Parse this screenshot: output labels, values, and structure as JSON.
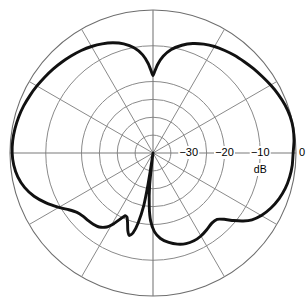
{
  "chart_data": {
    "type": "line",
    "plot_kind": "polar-radiation-pattern",
    "title": "",
    "subtitle": "",
    "xlabel": "",
    "ylabel": "",
    "unit_label": "dB",
    "radial_axis": {
      "label": "dB",
      "tick_labels": [
        "−30",
        "−20",
        "−10",
        "0"
      ],
      "tick_values": [
        -30,
        -20,
        -10,
        0
      ],
      "min": -40,
      "max": 0,
      "tick_angle_deg": 0
    },
    "angular_axis": {
      "spoke_interval_deg": 30,
      "spoke_angles_deg": [
        0,
        30,
        60,
        90,
        120,
        150,
        180,
        210,
        240,
        270,
        300,
        330
      ],
      "tick_labels": []
    },
    "grid": {
      "enabled": true,
      "rings_db": [
        -35,
        -30,
        -25,
        -20,
        -10,
        0
      ],
      "ring_color": "#8a8a8a",
      "outer_ring_color": "#6e6e6e"
    },
    "legend": {
      "position": "none",
      "entries": []
    },
    "series": [
      {
        "name": "pattern",
        "color": "#111111",
        "line_width": 2.9,
        "closed": true,
        "points_polar_deg_db": [
          [
            0,
            -0.8
          ],
          [
            5,
            -0.4
          ],
          [
            10,
            -0.2
          ],
          [
            15,
            -0.3
          ],
          [
            20,
            -0.7
          ],
          [
            25,
            -1.3
          ],
          [
            30,
            -2.0
          ],
          [
            35,
            -2.7
          ],
          [
            40,
            -3.3
          ],
          [
            45,
            -3.9
          ],
          [
            50,
            -4.4
          ],
          [
            55,
            -5.0
          ],
          [
            60,
            -5.6
          ],
          [
            65,
            -6.4
          ],
          [
            70,
            -7.4
          ],
          [
            75,
            -8.8
          ],
          [
            80,
            -10.6
          ],
          [
            84,
            -12.8
          ],
          [
            87,
            -15.2
          ],
          [
            89,
            -17.4
          ],
          [
            90,
            -18.4
          ],
          [
            91,
            -17.4
          ],
          [
            93,
            -15.0
          ],
          [
            96,
            -12.4
          ],
          [
            100,
            -10.2
          ],
          [
            105,
            -8.4
          ],
          [
            110,
            -7.2
          ],
          [
            115,
            -6.3
          ],
          [
            120,
            -5.6
          ],
          [
            125,
            -5.0
          ],
          [
            130,
            -4.5
          ],
          [
            135,
            -4.0
          ],
          [
            140,
            -3.5
          ],
          [
            145,
            -3.0
          ],
          [
            150,
            -2.5
          ],
          [
            155,
            -2.0
          ],
          [
            160,
            -1.5
          ],
          [
            165,
            -1.1
          ],
          [
            170,
            -0.8
          ],
          [
            175,
            -0.6
          ],
          [
            180,
            -0.6
          ],
          [
            185,
            -0.9
          ],
          [
            190,
            -1.6
          ],
          [
            195,
            -2.8
          ],
          [
            200,
            -4.6
          ],
          [
            205,
            -7.0
          ],
          [
            210,
            -9.6
          ],
          [
            214,
            -11.6
          ],
          [
            218,
            -13.0
          ],
          [
            222,
            -13.6
          ],
          [
            226,
            -13.8
          ],
          [
            230,
            -14.0
          ],
          [
            234,
            -14.4
          ],
          [
            238,
            -15.6
          ],
          [
            241,
            -17.4
          ],
          [
            244,
            -19.6
          ],
          [
            246,
            -20.8
          ],
          [
            248,
            -20.6
          ],
          [
            250,
            -19.2
          ],
          [
            252,
            -17.2
          ],
          [
            254,
            -16.0
          ],
          [
            256,
            -17.0
          ],
          [
            258,
            -20.0
          ],
          [
            260,
            -25.0
          ],
          [
            261,
            -31.0
          ],
          [
            262,
            -38.0
          ],
          [
            262.5,
            -41.0
          ],
          [
            263,
            -38.0
          ],
          [
            264,
            -31.0
          ],
          [
            266,
            -25.0
          ],
          [
            268,
            -21.0
          ],
          [
            271,
            -18.0
          ],
          [
            275,
            -16.0
          ],
          [
            280,
            -14.6
          ],
          [
            285,
            -13.6
          ],
          [
            290,
            -13.0
          ],
          [
            295,
            -12.9
          ],
          [
            300,
            -13.2
          ],
          [
            305,
            -13.8
          ],
          [
            310,
            -14.4
          ],
          [
            314,
            -14.2
          ],
          [
            317,
            -12.8
          ],
          [
            320,
            -10.6
          ],
          [
            323,
            -8.4
          ],
          [
            326,
            -6.6
          ],
          [
            330,
            -5.0
          ],
          [
            335,
            -3.6
          ],
          [
            340,
            -2.5
          ],
          [
            345,
            -1.7
          ],
          [
            350,
            -1.2
          ],
          [
            355,
            -0.9
          ],
          [
            360,
            -0.8
          ]
        ]
      }
    ],
    "geometry": {
      "center_x": 153,
      "center_y": 153,
      "outer_radius": 143
    }
  }
}
